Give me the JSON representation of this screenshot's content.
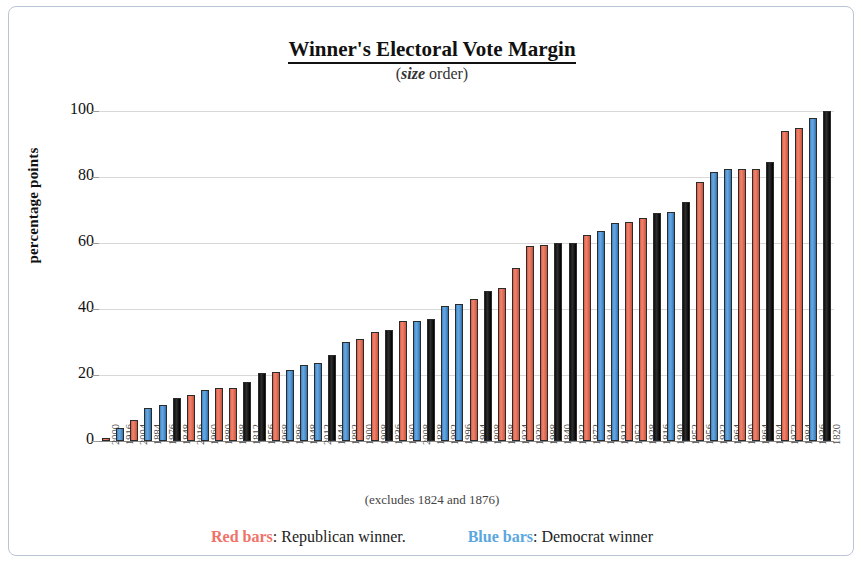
{
  "title": "Winner's Electoral Vote Margin",
  "subtitle_italic": "size",
  "subtitle_rest": " order)",
  "subtitle_open": "(",
  "note": "(excludes 1824 and 1876)",
  "legend": {
    "red_label": "Red bars",
    "red_text": ": Republican winner.",
    "blue_label": "Blue bars",
    "blue_text": ": Democrat winner"
  },
  "colors": {
    "republican": "#e06c55",
    "democrat": "#4e93d2",
    "other": "#141414",
    "grid": "#d8d8d8",
    "frame": "#b9c4d4"
  },
  "chart_data": {
    "type": "bar",
    "title": "Winner's Electoral Vote Margin",
    "subtitle": "(size order)",
    "xlabel": "",
    "ylabel": "percentage points",
    "ylim": [
      0,
      100
    ],
    "yticks": [
      0,
      20,
      40,
      60,
      80,
      100
    ],
    "grid": true,
    "legend_position": "below",
    "annotation": "(excludes 1824 and 1876)",
    "categories": [
      "2000",
      "1916",
      "2004",
      "1884",
      "1976",
      "1848",
      "2016",
      "1960",
      "1880",
      "1888",
      "1812",
      "1856",
      "1968",
      "1896",
      "1948",
      "2012",
      "1844",
      "1892",
      "1900",
      "1908",
      "1836",
      "1860",
      "2008",
      "1828",
      "1992",
      "1996",
      "1904",
      "1808",
      "1868",
      "1924",
      "1920",
      "1988",
      "1840",
      "1832",
      "1872",
      "1944",
      "1912",
      "1952",
      "1928",
      "1816",
      "1940",
      "1852",
      "1956",
      "1932",
      "1964",
      "1980",
      "1864",
      "1804",
      "1972",
      "1984",
      "1936",
      "1820"
    ],
    "values": [
      1,
      4,
      6.5,
      10,
      11,
      13,
      14,
      15.5,
      16,
      16,
      18,
      20.5,
      21,
      21.5,
      23,
      23.5,
      26,
      30,
      31,
      33,
      33.5,
      36.5,
      36.5,
      37,
      41,
      41.5,
      43,
      45.5,
      46.5,
      52.5,
      59,
      59.5,
      60,
      60,
      62.5,
      63.5,
      66,
      66.5,
      67.5,
      69,
      69.5,
      72.5,
      78.5,
      81.5,
      82.5,
      82.5,
      82.5,
      84.5,
      94,
      95,
      98,
      100
    ],
    "party": [
      "republican",
      "democrat",
      "republican",
      "democrat",
      "democrat",
      "other",
      "republican",
      "democrat",
      "republican",
      "republican",
      "other",
      "other",
      "republican",
      "democrat",
      "democrat",
      "democrat",
      "other",
      "democrat",
      "republican",
      "republican",
      "other",
      "republican",
      "democrat",
      "other",
      "democrat",
      "democrat",
      "republican",
      "other",
      "republican",
      "republican",
      "republican",
      "republican",
      "other",
      "other",
      "republican",
      "democrat",
      "democrat",
      "republican",
      "republican",
      "other",
      "democrat",
      "other",
      "republican",
      "democrat",
      "democrat",
      "republican",
      "republican",
      "other",
      "republican",
      "republican",
      "democrat",
      "other"
    ],
    "series": [
      {
        "name": "Republican winner",
        "color": "#e06c55"
      },
      {
        "name": "Democrat winner",
        "color": "#4e93d2"
      },
      {
        "name": "Other",
        "color": "#141414"
      }
    ]
  }
}
